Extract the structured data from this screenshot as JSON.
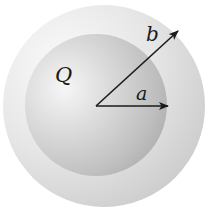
{
  "diagram": {
    "type": "concentric-spheres",
    "labels": {
      "charge": "Q",
      "inner_radius": "a",
      "outer_radius": "b"
    },
    "colors": {
      "inner_sphere_highlight": "#f2f2f2",
      "inner_sphere_mid": "#cfcfcf",
      "inner_sphere_shadow": "#a9a9a9",
      "outer_shell_light": "#f4f4f4",
      "outer_shell_mid": "#e2e2e2",
      "outer_shell_dark": "#cdcdcd",
      "arrow": "#1a1a1a"
    }
  }
}
